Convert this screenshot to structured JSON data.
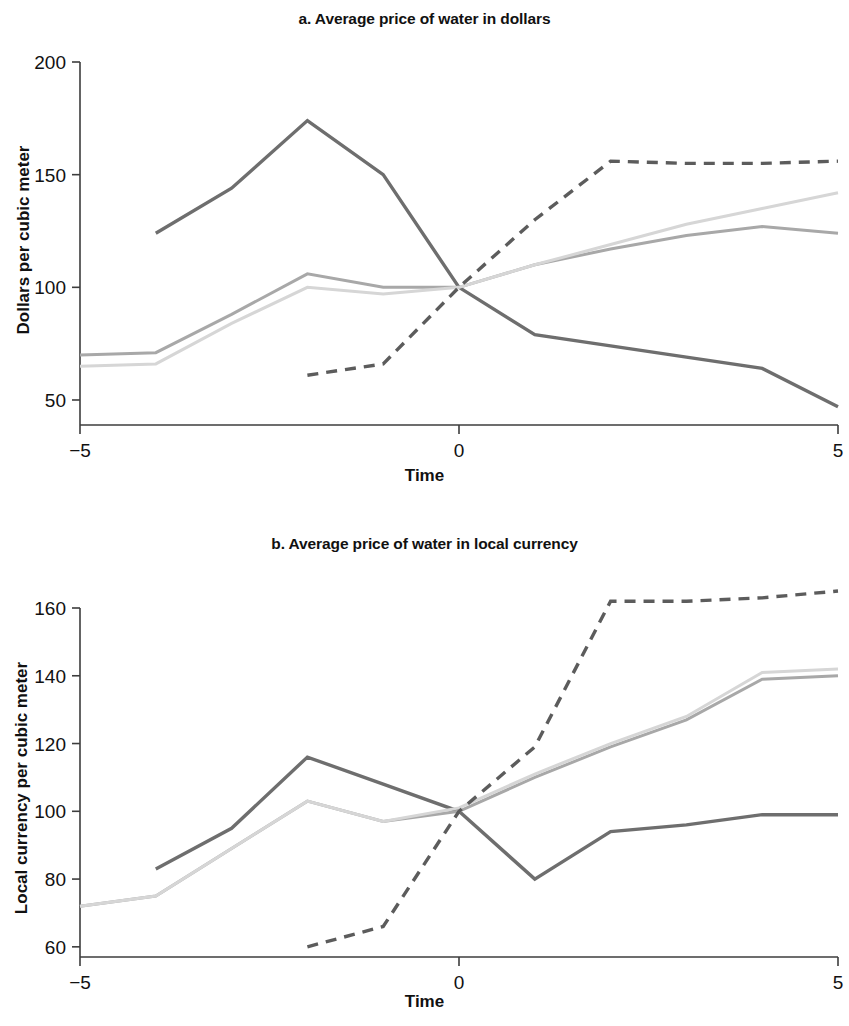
{
  "figure": {
    "panels": [
      {
        "id": "a",
        "title": "a. Average price of water in dollars",
        "xlabel": "Time",
        "ylabel": "Dollars per cubic meter"
      },
      {
        "id": "b",
        "title": "b. Average price of water in local currency",
        "xlabel": "Time",
        "ylabel": "Local currency per cubic meter"
      }
    ]
  },
  "colors": {
    "dark_gray": "#6e6e6e",
    "medium_gray": "#a8a8a8",
    "light_gray": "#d6d6d6",
    "dashed_gray": "#5c5c5c",
    "axis": "#3d3d3d",
    "text": "#111111",
    "background": "#ffffff"
  },
  "chart_data": [
    {
      "type": "line",
      "panel": "a",
      "title": "a. Average price of water in dollars",
      "xlabel": "Time",
      "ylabel": "Dollars per cubic meter",
      "xlim": [
        -5,
        5
      ],
      "ylim": [
        40,
        200
      ],
      "xticks": [
        -5,
        0,
        5
      ],
      "xticklabels": [
        "−5",
        "0",
        "5"
      ],
      "yticks": [
        50,
        100,
        150,
        200
      ],
      "yticklabels": [
        "50",
        "100",
        "150",
        "200"
      ],
      "grid": false,
      "legend": "none",
      "series": [
        {
          "name": "dark-solid",
          "style": "solid",
          "color": "#6e6e6e",
          "width": 3.4,
          "x": [
            -4,
            -3,
            -2,
            -1,
            0,
            1,
            2,
            3,
            4,
            5
          ],
          "values": [
            124,
            144,
            174,
            150,
            100,
            79,
            74,
            69,
            64,
            47
          ]
        },
        {
          "name": "medium-solid",
          "style": "solid",
          "color": "#a8a8a8",
          "width": 3.0,
          "x": [
            -5,
            -4,
            -3,
            -2,
            -1,
            0,
            1,
            2,
            3,
            4,
            5
          ],
          "values": [
            70,
            71,
            88,
            106,
            100,
            100,
            110,
            117,
            123,
            127,
            124
          ]
        },
        {
          "name": "light-solid",
          "style": "solid",
          "color": "#d6d6d6",
          "width": 3.0,
          "x": [
            -5,
            -4,
            -3,
            -2,
            -1,
            0,
            1,
            2,
            3,
            4,
            5
          ],
          "values": [
            65,
            66,
            84,
            100,
            97,
            100,
            110,
            119,
            128,
            135,
            142
          ]
        },
        {
          "name": "dark-dashed",
          "style": "dashed",
          "color": "#5c5c5c",
          "width": 3.4,
          "x": [
            -2,
            -1,
            0,
            1,
            2,
            3,
            4,
            5
          ],
          "values": [
            61,
            66,
            100,
            130,
            156,
            155,
            155,
            156
          ]
        }
      ]
    },
    {
      "type": "line",
      "panel": "b",
      "title": "b. Average price of water in local currency",
      "xlabel": "Time",
      "ylabel": "Local currency per cubic meter",
      "xlim": [
        -5,
        5
      ],
      "ylim": [
        55,
        170
      ],
      "xticks": [
        -5,
        0,
        5
      ],
      "xticklabels": [
        "−5",
        "0",
        "5"
      ],
      "yticks": [
        60,
        80,
        100,
        120,
        140,
        160
      ],
      "yticklabels": [
        "60",
        "80",
        "100",
        "120",
        "140",
        "160"
      ],
      "grid": false,
      "legend": "none",
      "series": [
        {
          "name": "dark-solid",
          "style": "solid",
          "color": "#6e6e6e",
          "width": 3.4,
          "x": [
            -4,
            -3,
            -2,
            -1,
            0,
            1,
            2,
            3,
            4,
            5
          ],
          "values": [
            83,
            95,
            116,
            108,
            100,
            80,
            94,
            96,
            99,
            99
          ]
        },
        {
          "name": "medium-solid",
          "style": "solid",
          "color": "#a8a8a8",
          "width": 3.0,
          "x": [
            -5,
            -4,
            -3,
            -2,
            -1,
            0,
            1,
            2,
            3,
            4,
            5
          ],
          "values": [
            72,
            75,
            89,
            103,
            97,
            100,
            110,
            119,
            127,
            139,
            140
          ]
        },
        {
          "name": "light-solid",
          "style": "solid",
          "color": "#d6d6d6",
          "width": 3.0,
          "x": [
            -5,
            -4,
            -3,
            -2,
            -1,
            0,
            1,
            2,
            3,
            4,
            5
          ],
          "values": [
            72,
            75,
            89,
            103,
            97,
            101,
            111,
            120,
            128,
            141,
            142
          ]
        },
        {
          "name": "dark-dashed",
          "style": "dashed",
          "color": "#5c5c5c",
          "width": 3.4,
          "x": [
            -2,
            -1,
            0,
            1,
            2,
            3,
            4,
            5
          ],
          "values": [
            60,
            66,
            100,
            119,
            162,
            162,
            163,
            165
          ]
        }
      ]
    }
  ],
  "geometry": {
    "a": {
      "x0": 80,
      "x1": 838,
      "ytop": 62,
      "ybottom": 425,
      "vtop": 200,
      "vbottom": 38.9
    },
    "b": {
      "x0": 80,
      "x1": 838,
      "ytop": 608,
      "ybottom": 957,
      "vtop": 160,
      "vbottom": 57.0
    }
  }
}
